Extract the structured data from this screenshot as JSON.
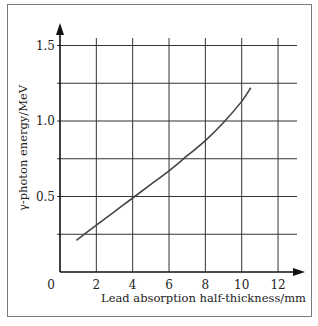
{
  "chart_data": {
    "type": "line",
    "title": "",
    "xlabel": "Lead absorption half-thickness/mm",
    "ylabel": "γ-photon energy/MeV",
    "xlim": [
      0,
      13
    ],
    "ylim": [
      0,
      1.6
    ],
    "x_ticks": [
      "0",
      "2",
      "4",
      "6",
      "8",
      "10",
      "12"
    ],
    "y_ticks": [
      "0.5",
      "1.0",
      "1.5"
    ],
    "x_grid": [
      2,
      4,
      6,
      8,
      10,
      12
    ],
    "y_grid": [
      0.25,
      0.5,
      0.75,
      1.0,
      1.25,
      1.5
    ],
    "grid": true,
    "legend": null,
    "series": [
      {
        "name": "γ-photon energy vs half-thickness",
        "x": [
          0.9,
          2.0,
          3.0,
          4.0,
          5.0,
          6.0,
          7.0,
          8.0,
          9.0,
          10.0,
          10.5
        ],
        "y": [
          0.21,
          0.31,
          0.4,
          0.49,
          0.58,
          0.67,
          0.77,
          0.87,
          0.99,
          1.13,
          1.22
        ]
      }
    ]
  },
  "colors": {
    "axis": "#111111",
    "grid": "#333333",
    "curve": "#444444",
    "frame": "#7a7a7a"
  }
}
